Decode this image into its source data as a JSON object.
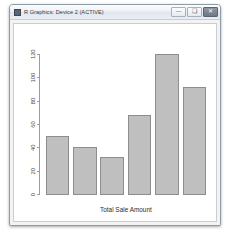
{
  "window": {
    "title": "R Graphics: Device 2 (ACTIVE)",
    "app_icon": "r-graphics-icon",
    "controls": {
      "minimize_label": "—",
      "maximize_label": "❑",
      "close_label": "✕"
    }
  },
  "chart_data": {
    "type": "bar",
    "title": "",
    "subtitle": "",
    "xlabel": "Total Sale Amount",
    "ylabel": "",
    "categories": [
      "",
      "",
      "",
      "",
      "",
      ""
    ],
    "values": [
      50,
      40,
      32,
      68,
      120,
      92
    ],
    "ylim": [
      0,
      120
    ],
    "yticks": [
      0,
      20,
      40,
      60,
      80,
      100,
      120
    ],
    "ytick_labels": [
      "0",
      "20",
      "40",
      "60",
      "80",
      "100",
      "120"
    ],
    "xticks": [],
    "xtick_labels": [],
    "grid": false,
    "legend": null,
    "legend_position": "none",
    "axis_rotation_y_labels": 90,
    "colors": {
      "bar_fill": "#bfbfbf",
      "bar_border": "#8c8c8c",
      "axis": "#9a9a9a",
      "text": "#3a3a3a",
      "plot_background": "#ffffff"
    }
  }
}
